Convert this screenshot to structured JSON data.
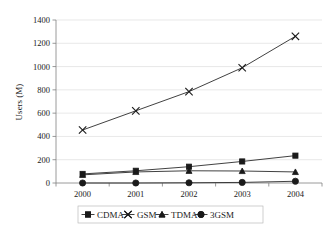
{
  "chart_data": {
    "type": "line",
    "title": "",
    "xlabel": "",
    "ylabel": "Users (M)",
    "categories": [
      "2000",
      "2001",
      "2002",
      "2003",
      "2004"
    ],
    "x": [
      2000,
      2001,
      2002,
      2003,
      2004
    ],
    "ylim": [
      0,
      1400
    ],
    "yticks": [
      0,
      200,
      400,
      600,
      800,
      1000,
      1200,
      1400
    ],
    "ytick_labels": [
      "0",
      "200",
      "400",
      "600",
      "800",
      "1000",
      "1200",
      "1400"
    ],
    "grid": true,
    "legend_position": "bottom",
    "series": [
      {
        "name": "CDMA",
        "marker": "square",
        "values": [
          78,
          105,
          140,
          185,
          235
        ]
      },
      {
        "name": "GSM",
        "marker": "x",
        "values": [
          455,
          620,
          785,
          990,
          1260
        ]
      },
      {
        "name": "TDMA",
        "marker": "triangle",
        "values": [
          70,
          95,
          105,
          103,
          95
        ]
      },
      {
        "name": "3GSM",
        "marker": "diamond",
        "values": [
          0,
          0,
          2,
          5,
          15
        ]
      }
    ]
  },
  "axes": {
    "y_title": "Users (M)"
  },
  "legend": {
    "items": [
      {
        "label": "CDMA",
        "marker": "square-marker-icon"
      },
      {
        "label": "GSM",
        "marker": "x-marker-icon"
      },
      {
        "label": "TDMA",
        "marker": "triangle-marker-icon"
      },
      {
        "label": "3GSM",
        "marker": "diamond-marker-icon"
      }
    ]
  },
  "colors": {
    "series": "#1a1a1a",
    "grid": "#d9d9d9",
    "axis": "#808080",
    "background": "#ffffff"
  }
}
